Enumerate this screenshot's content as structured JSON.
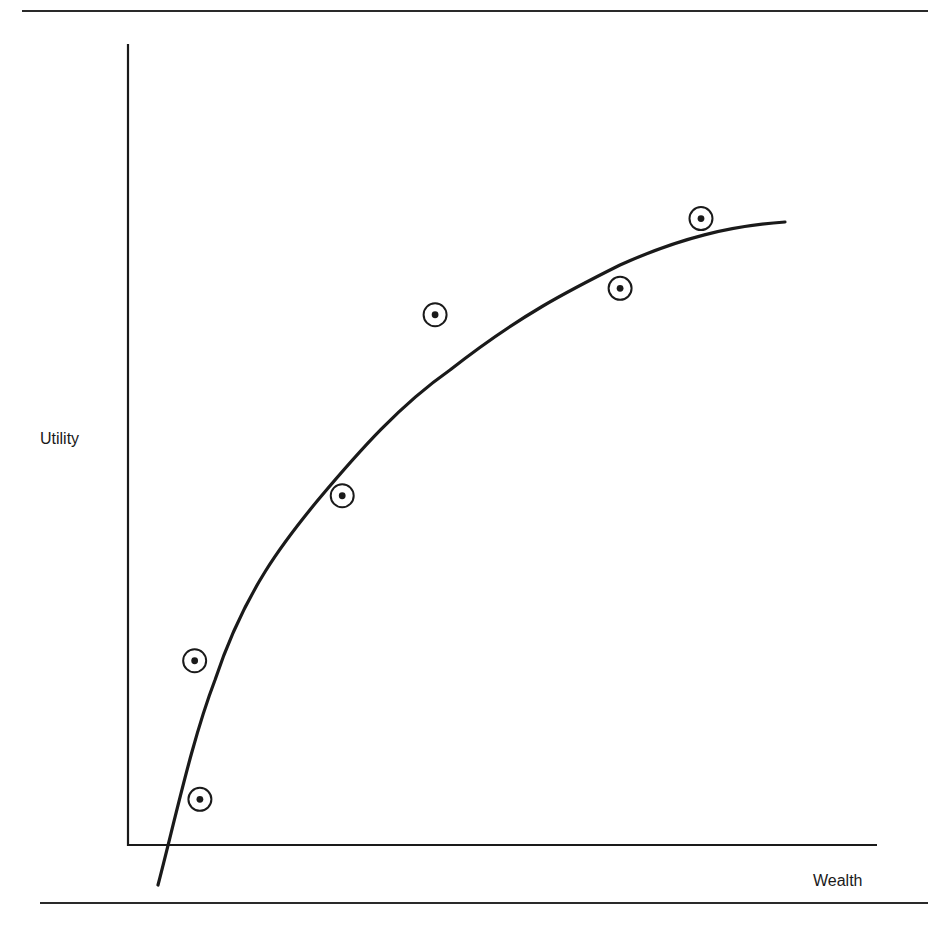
{
  "chart_data": {
    "type": "scatter",
    "title": "",
    "xlabel": "Wealth",
    "ylabel": "Utility",
    "xlim": [
      0,
      100
    ],
    "ylim": [
      0,
      100
    ],
    "grid": false,
    "legend": null,
    "ticks": {
      "x": [],
      "y": []
    },
    "series": [
      {
        "name": "observations",
        "marker": "circled-dot",
        "points": [
          {
            "x": 9.6,
            "y": 5.7
          },
          {
            "x": 8.9,
            "y": 23.0
          },
          {
            "x": 28.6,
            "y": 43.6
          },
          {
            "x": 41.0,
            "y": 66.2
          },
          {
            "x": 65.7,
            "y": 69.5
          },
          {
            "x": 76.5,
            "y": 78.2
          }
        ]
      },
      {
        "name": "fitted concave utility curve",
        "style": "line",
        "points": [
          {
            "x": 4.0,
            "y": -5.0
          },
          {
            "x": 11.6,
            "y": 20.6
          },
          {
            "x": 16.4,
            "y": 30.6
          },
          {
            "x": 25.4,
            "y": 43.1
          },
          {
            "x": 36.3,
            "y": 55.2
          },
          {
            "x": 49.6,
            "y": 65.2
          },
          {
            "x": 62.9,
            "y": 72.3
          },
          {
            "x": 87.7,
            "y": 77.8
          }
        ]
      }
    ]
  },
  "labels": {
    "y_axis": "Utility",
    "x_axis": "Wealth"
  },
  "colors": {
    "ink": "#1a1a1a",
    "background": "#ffffff"
  }
}
